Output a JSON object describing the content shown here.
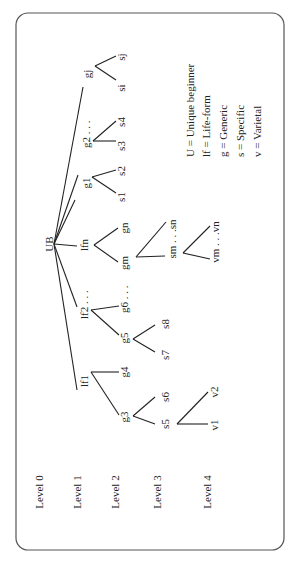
{
  "diagram": {
    "orientation": "rotated-90-ccw",
    "root": {
      "id": "UB",
      "label": "UB"
    },
    "levels": [
      {
        "label": "Level 0"
      },
      {
        "label": "Level 1"
      },
      {
        "label": "Level 2"
      },
      {
        "label": "Level 3"
      },
      {
        "label": "Level 4"
      }
    ],
    "nodes": {
      "UB": "UB",
      "lf1": "lf1",
      "lf2": "lf2 . . .",
      "lfn": "lfn",
      "g1": "g1",
      "g2": "g2 . . .",
      "g3": "g3",
      "g4": "g4",
      "g5": "g5",
      "g6": "g6 . . .",
      "gm": "gm",
      "gn": "gn",
      "gj": "gj",
      "s1": "s1",
      "s2": "s2",
      "s3": "s3",
      "s4": "s4",
      "s5": "s5",
      "s6": "s6",
      "s7": "s7",
      "s8": "s8",
      "sm": "sm . . .sn",
      "si": "si",
      "sj": "sj",
      "v1": "v1",
      "v2": "v2",
      "vm": "vm . . .vn"
    },
    "edges": [
      [
        "UB",
        "lf1"
      ],
      [
        "UB",
        "lf2"
      ],
      [
        "UB",
        "lfn"
      ],
      [
        "UB",
        "g1"
      ],
      [
        "UB",
        "g2"
      ],
      [
        "UB",
        "gj"
      ],
      [
        "lf1",
        "g3"
      ],
      [
        "lf1",
        "g4"
      ],
      [
        "lf2",
        "g5"
      ],
      [
        "lf2",
        "g6"
      ],
      [
        "lfn",
        "gm"
      ],
      [
        "lfn",
        "gn"
      ],
      [
        "g1",
        "s1"
      ],
      [
        "g1",
        "s2"
      ],
      [
        "g2",
        "s3"
      ],
      [
        "g2",
        "s4"
      ],
      [
        "gj",
        "si"
      ],
      [
        "gj",
        "sj"
      ],
      [
        "g3",
        "s5"
      ],
      [
        "g3",
        "s6"
      ],
      [
        "g5",
        "s7"
      ],
      [
        "g5",
        "s8"
      ],
      [
        "gm",
        "sm"
      ],
      [
        "gm",
        "sn"
      ],
      [
        "s5",
        "v1"
      ],
      [
        "s5",
        "v2"
      ],
      [
        "sm",
        "vm"
      ],
      [
        "sm",
        "vn"
      ]
    ],
    "legend": [
      "U = Unique beginner",
      "lf =  Life-form",
      "g = Generic",
      "s = Specific",
      "v = Varietal"
    ]
  }
}
